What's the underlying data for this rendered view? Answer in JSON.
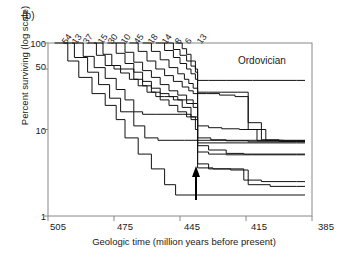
{
  "figure": {
    "panel_label": "(b)",
    "annotation": "Ordovician",
    "arrow_marker": "extinction-event-arrow"
  },
  "chart_data": {
    "type": "line",
    "title": "",
    "subtitle": "",
    "xlabel": "Geologic time (million years before present)",
    "ylabel": "Percent surviving (log scale)",
    "xlim": [
      505,
      385
    ],
    "ylim": [
      1,
      100
    ],
    "xticks": [
      505,
      475,
      445,
      415,
      385
    ],
    "yticks": [
      1,
      10,
      50,
      100
    ],
    "y_scale": "log",
    "x_direction": "reversed",
    "grid": false,
    "legend": "cohort size labels above curve origins",
    "annotations": [
      {
        "text": "Ordovician",
        "x": 423,
        "y": 62
      },
      {
        "text": "(b)",
        "x": 0,
        "y": 0
      },
      {
        "text": "extinction arrow",
        "x": 437,
        "y_from": 1.6,
        "y_to": 3.6
      }
    ],
    "cohort_labels": [
      "54",
      "13",
      "37",
      "15",
      "30",
      "10",
      "45",
      "18",
      "14",
      "8",
      "6",
      "13"
    ],
    "series": [
      {
        "name": "54",
        "label": "54",
        "start_x": 502,
        "points": [
          [
            502,
            100
          ],
          [
            496,
            62
          ],
          [
            491,
            40
          ],
          [
            485,
            26
          ],
          [
            479,
            19
          ],
          [
            474,
            13
          ],
          [
            470,
            8
          ],
          [
            464,
            5.2
          ],
          [
            458,
            3.5
          ],
          [
            452,
            2.3
          ],
          [
            447,
            1.75
          ],
          [
            437,
            1.75
          ],
          [
            430,
            1.75
          ]
        ]
      },
      {
        "name": "13",
        "label": "13",
        "start_x": 498,
        "points": [
          [
            498,
            100
          ],
          [
            493,
            68
          ],
          [
            487,
            46
          ],
          [
            482,
            33
          ],
          [
            477,
            23
          ],
          [
            472,
            16
          ],
          [
            466,
            11
          ],
          [
            461,
            8
          ],
          [
            455,
            7.5
          ],
          [
            449,
            7.5
          ],
          [
            443,
            7.5
          ],
          [
            437,
            7.5
          ],
          [
            430,
            7.5
          ]
        ]
      },
      {
        "name": "37",
        "label": "37",
        "start_x": 494,
        "points": [
          [
            494,
            100
          ],
          [
            489,
            70
          ],
          [
            484,
            52
          ],
          [
            479,
            39
          ],
          [
            474,
            29
          ],
          [
            470,
            22
          ],
          [
            466,
            16
          ],
          [
            462,
            15
          ],
          [
            456,
            15
          ],
          [
            450,
            15
          ],
          [
            444,
            15
          ],
          [
            440,
            14
          ],
          [
            437,
            7
          ],
          [
            430,
            7
          ],
          [
            420,
            7
          ],
          [
            392,
            7
          ]
        ]
      },
      {
        "name": "15",
        "label": "15",
        "start_x": 487,
        "points": [
          [
            487,
            100
          ],
          [
            483,
            72
          ],
          [
            479,
            55
          ],
          [
            475,
            50
          ],
          [
            470,
            50
          ],
          [
            466,
            38
          ],
          [
            462,
            32
          ],
          [
            458,
            27
          ],
          [
            454,
            22
          ],
          [
            450,
            19
          ],
          [
            446,
            16
          ],
          [
            442,
            14
          ],
          [
            438,
            10
          ],
          [
            437,
            4
          ],
          [
            432,
            3.5
          ],
          [
            424,
            3.5
          ],
          [
            416,
            2.6
          ],
          [
            408,
            2.5
          ],
          [
            392,
            2.5
          ]
        ]
      },
      {
        "name": "30",
        "label": "30",
        "start_x": 484,
        "points": [
          [
            484,
            100
          ],
          [
            480,
            74
          ],
          [
            476,
            55
          ],
          [
            472,
            45
          ],
          [
            468,
            38
          ],
          [
            464,
            32
          ],
          [
            460,
            27
          ],
          [
            456,
            24
          ],
          [
            452,
            24
          ],
          [
            448,
            22
          ],
          [
            444,
            18
          ],
          [
            440,
            13
          ],
          [
            437,
            6.5
          ],
          [
            432,
            5.8
          ],
          [
            424,
            5.3
          ],
          [
            416,
            5.2
          ],
          [
            404,
            5.2
          ],
          [
            392,
            5.2
          ]
        ]
      },
      {
        "name": "10",
        "label": "10",
        "start_x": 478,
        "points": [
          [
            478,
            100
          ],
          [
            474,
            76
          ],
          [
            470,
            58
          ],
          [
            466,
            46
          ],
          [
            462,
            36
          ],
          [
            458,
            30
          ],
          [
            454,
            26
          ],
          [
            450,
            24
          ],
          [
            446,
            22
          ],
          [
            442,
            20
          ],
          [
            439,
            18
          ],
          [
            437,
            8
          ],
          [
            431,
            7.6
          ],
          [
            424,
            7.4
          ],
          [
            414,
            7.2
          ],
          [
            400,
            7.2
          ],
          [
            392,
            7.2
          ]
        ]
      },
      {
        "name": "45",
        "label": "45",
        "start_x": 474,
        "points": [
          [
            474,
            100
          ],
          [
            470,
            78
          ],
          [
            466,
            60
          ],
          [
            462,
            48
          ],
          [
            458,
            40
          ],
          [
            454,
            33
          ],
          [
            450,
            28
          ],
          [
            446,
            25
          ],
          [
            442,
            22
          ],
          [
            439,
            20
          ],
          [
            437,
            11
          ],
          [
            432,
            10.5
          ],
          [
            426,
            10.2
          ],
          [
            418,
            10
          ],
          [
            410,
            7.4
          ],
          [
            400,
            7.3
          ],
          [
            392,
            7.3
          ]
        ]
      },
      {
        "name": "18",
        "label": "18",
        "start_x": 468,
        "points": [
          [
            468,
            100
          ],
          [
            464,
            80
          ],
          [
            460,
            62
          ],
          [
            456,
            50
          ],
          [
            452,
            42
          ],
          [
            448,
            36
          ],
          [
            444,
            31
          ],
          [
            441,
            28
          ],
          [
            439,
            26
          ],
          [
            437,
            26
          ],
          [
            433,
            26
          ],
          [
            427,
            25
          ],
          [
            420,
            24
          ],
          [
            414,
            10
          ],
          [
            406,
            7.5
          ],
          [
            398,
            7.3
          ],
          [
            392,
            7.3
          ]
        ]
      },
      {
        "name": "14",
        "label": "14",
        "start_x": 462,
        "points": [
          [
            462,
            100
          ],
          [
            458,
            80
          ],
          [
            454,
            64
          ],
          [
            450,
            52
          ],
          [
            446,
            44
          ],
          [
            443,
            38
          ],
          [
            441,
            34
          ],
          [
            439,
            30
          ],
          [
            437,
            27
          ],
          [
            432,
            27
          ],
          [
            426,
            27
          ],
          [
            419,
            27
          ],
          [
            414,
            12
          ],
          [
            408,
            7.6
          ],
          [
            400,
            7.4
          ],
          [
            392,
            7.4
          ]
        ]
      },
      {
        "name": "8",
        "label": "8",
        "start_x": 456,
        "points": [
          [
            456,
            100
          ],
          [
            452,
            82
          ],
          [
            448,
            68
          ],
          [
            445,
            58
          ],
          [
            442,
            50
          ],
          [
            440,
            44
          ],
          [
            438,
            38
          ],
          [
            437,
            5.5
          ],
          [
            432,
            5.2
          ],
          [
            424,
            5.1
          ],
          [
            412,
            5.1
          ],
          [
            400,
            5.1
          ],
          [
            392,
            5.1
          ]
        ]
      },
      {
        "name": "6",
        "label": "6",
        "start_x": 452,
        "points": [
          [
            452,
            100
          ],
          [
            448,
            84
          ],
          [
            445,
            72
          ],
          [
            442,
            62
          ],
          [
            440,
            54
          ],
          [
            438,
            46
          ],
          [
            437,
            3.6
          ],
          [
            430,
            3.5
          ],
          [
            422,
            3.4
          ],
          [
            414,
            2.3
          ],
          [
            404,
            2.2
          ],
          [
            392,
            2.2
          ]
        ]
      },
      {
        "name": "13b",
        "label": "13",
        "start_x": 447,
        "points": [
          [
            447,
            100
          ],
          [
            444,
            86
          ],
          [
            442,
            74
          ],
          [
            440,
            62
          ],
          [
            438,
            50
          ],
          [
            437,
            37
          ],
          [
            432,
            37
          ],
          [
            424,
            37
          ],
          [
            412,
            37
          ],
          [
            400,
            37
          ],
          [
            392,
            37
          ]
        ]
      }
    ]
  }
}
